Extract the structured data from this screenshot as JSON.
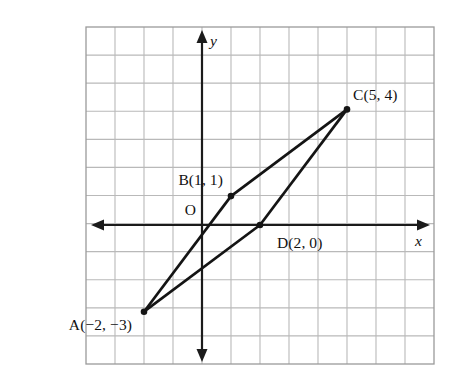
{
  "figure": {
    "kind": "coordinate-plane-diagram",
    "background_color": "#ffffff",
    "grid": {
      "color": "#b9b9b9",
      "border_color": "#9a9a9a",
      "columns": 12,
      "rows": 12,
      "cell_px": 29,
      "left_px": 86,
      "top_px": 27,
      "right_px": 434,
      "bottom_px": 364,
      "visible": true
    },
    "axes": {
      "color": "#1b1b1b",
      "origin_px": {
        "x": 202,
        "y": 225
      },
      "unit_px": {
        "x": 29,
        "y": 28.9
      },
      "x_axis_label": "x",
      "y_axis_label": "y",
      "origin_label": "O",
      "x_range": [
        -4,
        8
      ],
      "y_range": [
        -5,
        7
      ],
      "double_headed": true
    },
    "points": [
      {
        "id": "A",
        "label": "A(−2, −3)",
        "x": -2,
        "y": -3,
        "label_side": "below-left"
      },
      {
        "id": "B",
        "label": "B(1, 1)",
        "x": 1,
        "y": 1,
        "label_side": "above-left"
      },
      {
        "id": "C",
        "label": "C(5, 4)",
        "x": 5,
        "y": 4,
        "label_side": "above-right"
      },
      {
        "id": "D",
        "label": "D(2, 0)",
        "x": 2,
        "y": 0,
        "label_side": "below-right"
      }
    ],
    "segments": [
      {
        "from": "A",
        "to": "B",
        "color": "#141414"
      },
      {
        "from": "B",
        "to": "C",
        "color": "#141414"
      },
      {
        "from": "A",
        "to": "D",
        "color": "#141414"
      },
      {
        "from": "D",
        "to": "C",
        "color": "#141414"
      }
    ],
    "marked_vertices": [
      "A",
      "B",
      "C",
      "D"
    ],
    "shape_color": "#141414"
  }
}
